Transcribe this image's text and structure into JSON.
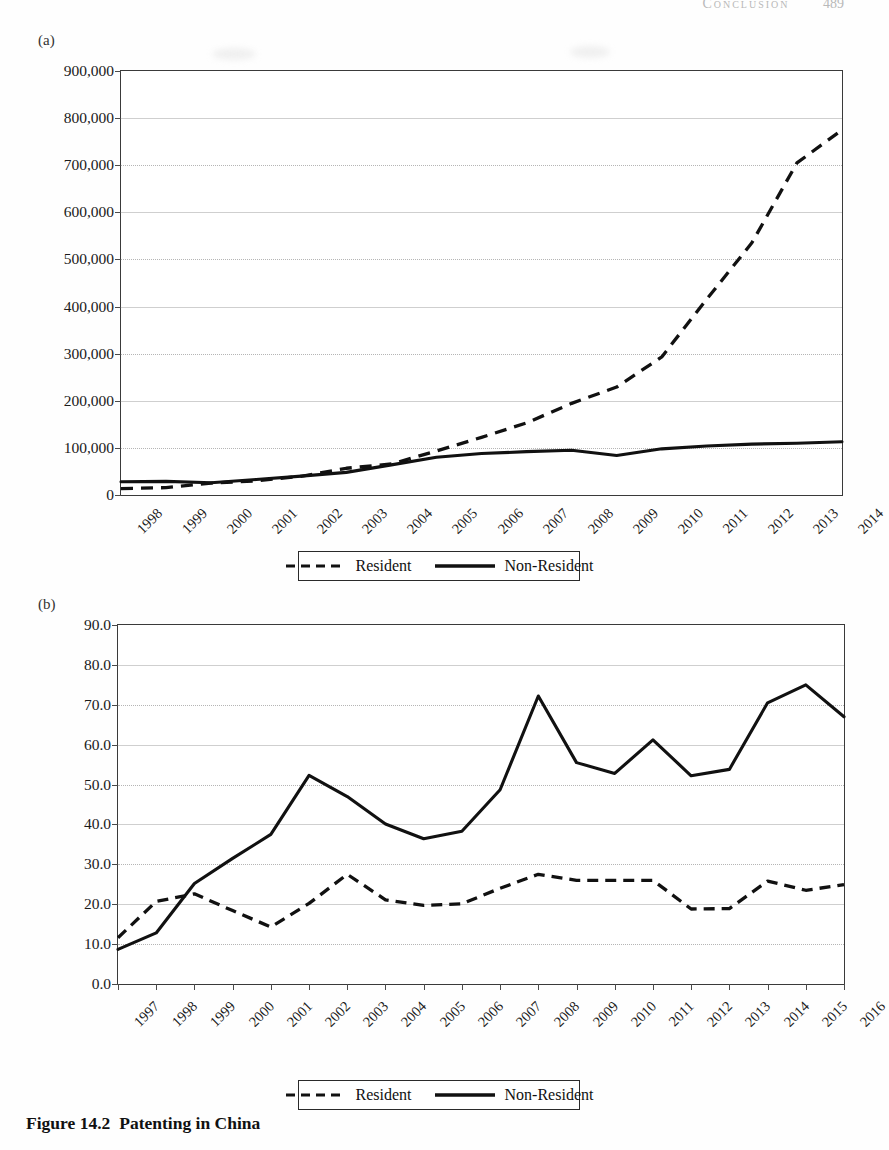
{
  "running_head": {
    "title": "Conclusion",
    "page_number": "489"
  },
  "figure": {
    "caption_number": "Figure 14.2",
    "caption_title": "Patenting in China"
  },
  "legend": {
    "resident_label": "Resident",
    "non_resident_label": "Non-Resident",
    "resident_style": "dashed",
    "non_resident_style": "solid"
  },
  "panels": [
    {
      "id": "a",
      "label": "(a)"
    },
    {
      "id": "b",
      "label": "(b)"
    }
  ],
  "chart_data": [
    {
      "panel": "(a)",
      "type": "line",
      "title": "",
      "xlabel": "",
      "ylabel": "",
      "ylim": [
        0,
        900000
      ],
      "ytick_labels": [
        "0",
        "100,000",
        "200,000",
        "300,000",
        "400,000",
        "500,000",
        "600,000",
        "700,000",
        "800,000",
        "900,000"
      ],
      "ytick_values": [
        0,
        100000,
        200000,
        300000,
        400000,
        500000,
        600000,
        700000,
        800000,
        900000
      ],
      "grid": true,
      "legend_position": "below-plot",
      "categories": [
        "1998",
        "1999",
        "2000",
        "2001",
        "2002",
        "2003",
        "2004",
        "2005",
        "2006",
        "2007",
        "2008",
        "2009",
        "2010",
        "2011",
        "2012",
        "2013",
        "2014"
      ],
      "series": [
        {
          "name": "Resident",
          "style": "dashed",
          "values": [
            13726,
            15626,
            25346,
            30038,
            39806,
            56769,
            65786,
            93485,
            122318,
            153060,
            194579,
            229096,
            293066,
            415829,
            535313,
            704936,
            775000
          ]
        },
        {
          "name": "Non-Resident",
          "style": "solid",
          "values": [
            28000,
            29000,
            26000,
            33000,
            40000,
            48000,
            64000,
            80000,
            88000,
            92000,
            95000,
            84000,
            98000,
            104000,
            108000,
            110000,
            113000
          ]
        }
      ]
    },
    {
      "panel": "(b)",
      "type": "line",
      "title": "",
      "xlabel": "",
      "ylabel": "",
      "ylim": [
        0,
        90
      ],
      "ytick_labels": [
        "0.0",
        "10.0",
        "20.0",
        "30.0",
        "40.0",
        "50.0",
        "60.0",
        "70.0",
        "80.0",
        "90.0"
      ],
      "ytick_values": [
        0,
        10,
        20,
        30,
        40,
        50,
        60,
        70,
        80,
        90
      ],
      "grid": true,
      "legend_position": "below-plot",
      "categories": [
        "1997",
        "1998",
        "1999",
        "2000",
        "2001",
        "2002",
        "2003",
        "2004",
        "2005",
        "2006",
        "2007",
        "2008",
        "2009",
        "2010",
        "2011",
        "2012",
        "2013",
        "2014",
        "2015",
        "2016"
      ],
      "series": [
        {
          "name": "Resident",
          "style": "dashed",
          "values": [
            11.6,
            20.7,
            22.6,
            18.4,
            14.3,
            20.2,
            27.5,
            21.1,
            19.7,
            20.1,
            24.0,
            27.5,
            26.0,
            26.0,
            26.0,
            18.8,
            18.9,
            25.8,
            23.5,
            24.9
          ]
        },
        {
          "name": "Non-Resident",
          "style": "solid",
          "values": [
            8.7,
            12.8,
            25.2,
            31.5,
            37.5,
            52.3,
            47.0,
            40.1,
            36.4,
            38.3,
            48.7,
            72.2,
            55.5,
            52.8,
            61.2,
            52.2,
            53.8,
            70.5,
            75.0,
            67.0
          ]
        }
      ]
    }
  ]
}
